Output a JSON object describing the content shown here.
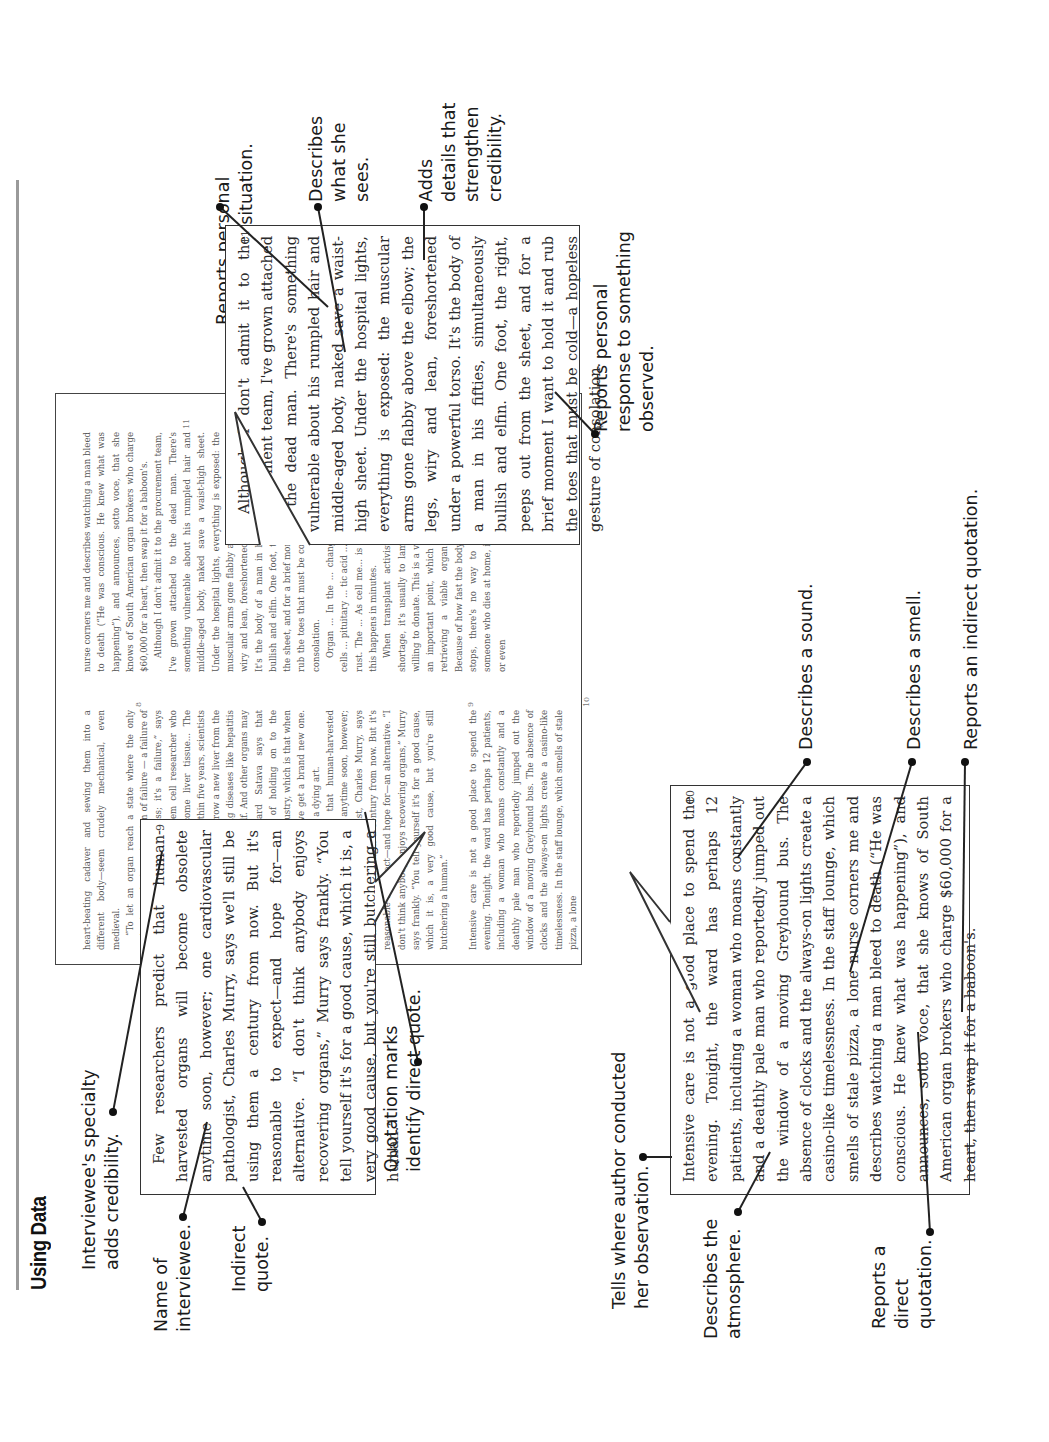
{
  "page": {
    "heading": "Using Data"
  },
  "annotations": {
    "interviewee_specialty": "Interviewee's specialty\nadds credibility.",
    "name_of_interviewee": "Name of\ninterviewee.",
    "indirect_quote": "Indirect\nquote.",
    "quotation_marks": "Quotation marks\nidentify direct quote.",
    "tells_where": "Tells where author conducted\nher observation.",
    "describes_atmosphere": "Describes the\natmosphere.",
    "reports_direct_quotation": "Reports a\ndirect\nquotation.",
    "reports_personal_reaction": "Reports personal\nreaction to situation.",
    "describes_what_she_sees": "Describes\nwhat she\nsees.",
    "adds_details": "Adds\ndetails that\nstrengthen\ncredibility.",
    "reports_personal_response": "Reports personal\nresponse to something\nobserved.",
    "describes_sound": "Describes a sound.",
    "describes_smell": "Describes a smell.",
    "reports_indirect_quotation": "Reports an indirect quotation."
  },
  "article": {
    "col1": {
      "p1": "heart-beating cadaver and sewing them into a different body—seem crudely mechanical, even medieval.",
      "p2": "“To let an organ reach a state where the only option is to take it out is a sign of failure — a failure of science, a failure of progress; it's a failure,” says pathologist Neil Theise, a stem cell researcher who believes liver cells can become liver tissue... The future of transplantation... Within five years, scientists hope to instruct the body to grow a new liver from the bone marrow, hopefully curing diseases like hepatitis and letting the liver heal itself. And other organs may follow similar paths. Richard Satava says that medicine is on the verge of holding on to the fundamental lesson of the industry, which is that when our car's generator breaks, we get a brand new one. Transplantation, he argues, is a dying art.",
      "p3": "Few researchers predict that human-harvested organs will become obsolete anytime soon, however; one cardiovascular pathologist, Charles Murry, says we'll still be using them a century from now. But it's reasonable to expect—and hope for—an alternative. “I don't think anybody enjoys recovering organs,” Murry says frankly. “You tell yourself it's for a good cause, which it is, a very good cause, but you're still butchering a human.”",
      "p4": "Intensive care is not a good place to spend the evening. Tonight, the ward has perhaps 12 patients, including a woman who moans constantly and a deathly pale man who reportedly jumped out the window of a moving Greyhound bus. The absence of clocks and the always-on lights create a casino-like timelessness. In the staff lounge, which smells of stale pizza, a lone"
    },
    "col2": {
      "p1": "nurse corners me and describes watching a man bleed to death (“He was conscious. He knew what was happening”), and announces, sotto voce, that she knows of South American organ brokers who charge $60,000 for a heart, then swap it for a baboon's.",
      "p2": "Although I don't admit it to the procurement team, I've grown attached to the dead man. There's something vulnerable about his rumpled hair and middle-aged body, naked save a waist-high sheet. Under the hospital lights, everything is exposed: the muscular arms gone flabby above the elbow; the legs, wiry and lean, foreshortened under a powerful torso. It's the body of a man in his fifties, simultaneously bullish and elfin. One foot, the right, peeps out from the sheet, and for a brief moment I want to hold it and rub the toes that must be cold—a hopeless gesture of consolation.",
      "p3": "Organ ... In the ... changes ... diminishes ... into cells ... pituitary ... tic acid ... ner. Free ... rupt other ... rust. The ... As cell me... is activated ... destruct. All this happens in minutes.",
      "p4": "When transplant activists talk about an organ shortage, it's usually to lament how few people are willing to donate. This is a valid worry, but it eclipses an important point, which is that the window for retrieving a viable organ is staggeringly small. Because of how fast the body degrades once the heart stops, there's no way to recover an organ from someone who dies at home, in a car, in an ambulance, or even"
    },
    "line_numbers": {
      "n8": "8",
      "n9": "9",
      "n10": "10",
      "n11": "11",
      "n13": "13"
    }
  },
  "callouts": {
    "murry": {
      "number": "9",
      "text": "Few researchers predict that human-harvested organs will become obsolete anytime soon, however; one cardiovascular pathologist, Charles Murry, says we'll still be using them a century from now. But it's reasonable to expect—and hope for—an alternative. “I don't think anybody enjoys recovering organs,” Murry says frankly. “You tell yourself it's for a good cause, which it is, a very good cause, but you're still butchering a human.”"
    },
    "dead_man": {
      "number": "11",
      "text": "Although I don't admit it to the procurement team, I've grown attached to the dead man. There's something vulnerable about his rumpled hair and middle-aged body, naked save a waist-high sheet. Under the hospital lights, everything is exposed: the muscular arms gone flabby above the elbow; the legs, wiry and lean, foreshortened under a powerful torso. It's the body of a man in his fifties, simultaneously bullish and elfin. One foot, the right, peeps out from the sheet, and for a brief moment I want to hold it and rub the toes that must be cold—a hopeless gesture of consolation."
    },
    "intensive_care": {
      "number": "10",
      "text": "Intensive care is not a good place to spend the evening. Tonight, the ward has perhaps 12 patients, including a woman who moans constantly and a deathly pale man who reportedly jumped out the window of a moving Greyhound bus. The absence of clocks and the always-on lights create a casino-like timelessness. In the staff lounge, which smells of stale pizza, a lone nurse corners me and describes watching a man bleed to death (“He was conscious. He knew what was happening”), and announces, sotto voce, that she knows of South American organ brokers who charge $60,000 for a heart, then swap it for a baboon's."
    }
  }
}
